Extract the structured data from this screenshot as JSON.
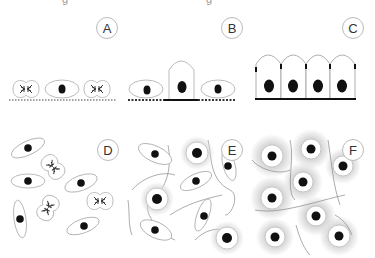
{
  "panels": [
    {
      "id": "A",
      "label": "A",
      "description": "Single isolated cells on dotted basement membrane; two dividing (mitotic) cells flanking an interphase cell"
    },
    {
      "id": "B",
      "label": "B",
      "description": "Central columnar cell on solid membrane segment flanked by two flat cells on dotted membrane"
    },
    {
      "id": "C",
      "label": "C",
      "description": "Four columnar cells in a polarized row with junctions on a solid basement membrane"
    },
    {
      "id": "D",
      "label": "D",
      "description": "Scattered elongated and mitotic cells with no matrix"
    },
    {
      "id": "E",
      "label": "E",
      "description": "Elongated and rounded cells embedded in fibrous matrix, some with grey halos"
    },
    {
      "id": "F",
      "label": "F",
      "description": "Rounded cells with large grey pericellular halos in fibrous matrix"
    }
  ],
  "top_cut_text": [
    "g",
    "g"
  ]
}
